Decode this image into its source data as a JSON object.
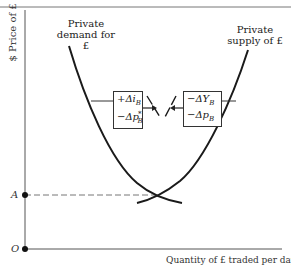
{
  "diagram": {
    "y_axis_label": "$ Price of £",
    "x_axis_label": "Quantity of £ traded per day",
    "origin_label": "O",
    "equilibrium_price_label": "A",
    "curves": [
      {
        "name": "demand",
        "label_line1": "Private",
        "label_line2": "demand for £"
      },
      {
        "name": "supply",
        "label_line1": "Private",
        "label_line2": "supply of £"
      }
    ],
    "shift_boxes": [
      {
        "name": "demand-shift",
        "line1": "+Δi_B",
        "line2": "−Δp*_B",
        "line1_display": "+Δi",
        "line1_sub": "B",
        "line2_display": "−Δp",
        "line2_sup": "*",
        "line2_sub": "B"
      },
      {
        "name": "supply-shift",
        "line1": "−ΔY_B",
        "line2": "−Δp_B",
        "line1_display": "−ΔY",
        "line1_sub": "B",
        "line2_display": "−Δp",
        "line2_sub": "B"
      }
    ],
    "colors": {
      "line": "#1a1a1a",
      "axis": "#555555",
      "dashed": "#777777",
      "frame": "#777777"
    }
  }
}
